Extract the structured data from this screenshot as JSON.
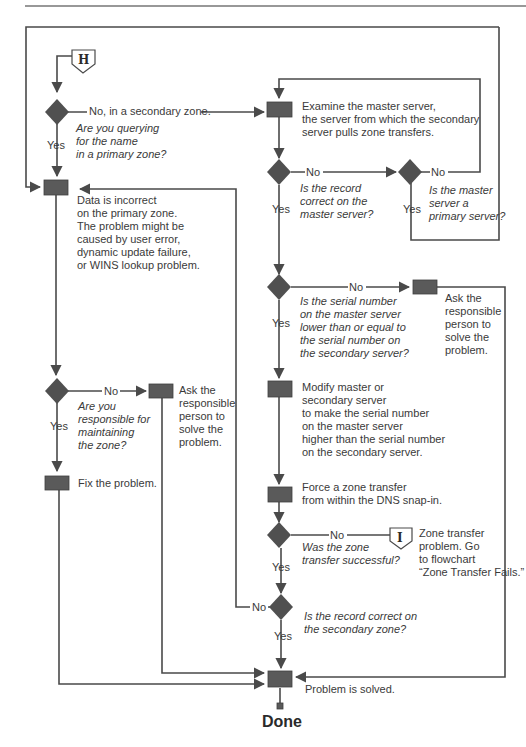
{
  "diagram": {
    "type": "flowchart",
    "colors": {
      "shape_fill": "#555555",
      "line": "#4a4a4a",
      "text": "#3a3a3a",
      "background": "#ffffff"
    },
    "connectors": {
      "H": "H",
      "I": "I"
    },
    "nodes": {
      "q_primary": {
        "kind": "decision",
        "lines": [
          "Are you querying",
          "for the name",
          "in a primary zone?"
        ]
      },
      "data_incorrect": {
        "kind": "process",
        "lines": [
          "Data is incorrect",
          "on the primary zone.",
          "The problem might be",
          "caused by user error,",
          "dynamic update failure,",
          "or WINS lookup problem."
        ]
      },
      "examine_master": {
        "kind": "process",
        "lines": [
          "Examine the master server,",
          "the server from which the secondary",
          "server pulls zone transfers."
        ]
      },
      "q_record_master": {
        "kind": "decision",
        "lines": [
          "Is the record",
          "correct on the",
          "master server?"
        ]
      },
      "q_master_primary": {
        "kind": "decision",
        "lines": [
          "Is the master",
          "server a",
          "primary server?"
        ]
      },
      "q_serial": {
        "kind": "decision",
        "lines": [
          "Is the serial number",
          "on the master server",
          "lower than or equal to",
          "the serial number on",
          "the secondary server?"
        ]
      },
      "ask_right": {
        "kind": "process",
        "lines": [
          "Ask the",
          "responsible",
          "person to",
          "solve the",
          "problem."
        ]
      },
      "modify": {
        "kind": "process",
        "lines": [
          "Modify master or",
          "secondary server",
          "to make the serial number",
          "on the master server",
          "higher than the serial number",
          "on the secondary server."
        ]
      },
      "force_transfer": {
        "kind": "process",
        "lines": [
          "Force a zone transfer",
          "from within the DNS snap-in."
        ]
      },
      "q_transfer_ok": {
        "kind": "decision",
        "lines": [
          "Was the zone",
          "transfer successful?"
        ]
      },
      "transfer_problem": {
        "kind": "note",
        "lines": [
          "Zone transfer",
          "problem. Go",
          "to flowchart",
          "“Zone Transfer Fails.”"
        ]
      },
      "q_record_secondary": {
        "kind": "decision",
        "lines": [
          "Is the record correct on",
          "the secondary zone?"
        ]
      },
      "q_responsible": {
        "kind": "decision",
        "lines": [
          "Are you",
          "responsible for",
          "maintaining",
          "the zone?"
        ]
      },
      "ask_left": {
        "kind": "process",
        "lines": [
          "Ask the",
          "responsible",
          "person to",
          "solve the",
          "problem."
        ]
      },
      "fix": {
        "kind": "process",
        "lines": [
          "Fix the problem."
        ]
      },
      "solved": {
        "kind": "process",
        "lines": [
          "Problem is solved."
        ]
      },
      "done": {
        "kind": "terminal",
        "label": "Done"
      }
    },
    "edge_labels": {
      "no_secondary": "No, in a secondary zone.",
      "yes": "Yes",
      "no": "No"
    }
  }
}
